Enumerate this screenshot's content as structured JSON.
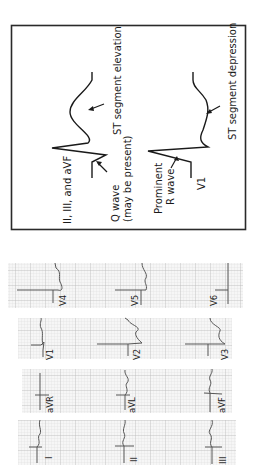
{
  "diagram": {
    "inferior_leads_label": "II, III, and aVF",
    "q_wave_label_line1": "Q wave",
    "q_wave_label_line2": "(may be present)",
    "st_elevation_label": "ST segment elevation",
    "prominent_r_label_line1": "Prominent",
    "prominent_r_label_line2": "R wave",
    "v1_label": "V1",
    "st_depression_label": "ST segment depression"
  },
  "ecg": {
    "rows": [
      {
        "leads": [
          "V4",
          "V5",
          "V6"
        ]
      },
      {
        "leads": [
          "V1",
          "V2",
          "V3"
        ]
      },
      {
        "leads": [
          "aVR",
          "aVL",
          "aVF"
        ]
      },
      {
        "leads": [
          "I",
          "II",
          "III"
        ]
      }
    ]
  },
  "colors": {
    "ink": "#1a1a1a",
    "grid_minor": "#d6d6d6",
    "grid_major": "#b5b5b5",
    "trace": "#555555",
    "paper": "#f4f4f4"
  }
}
